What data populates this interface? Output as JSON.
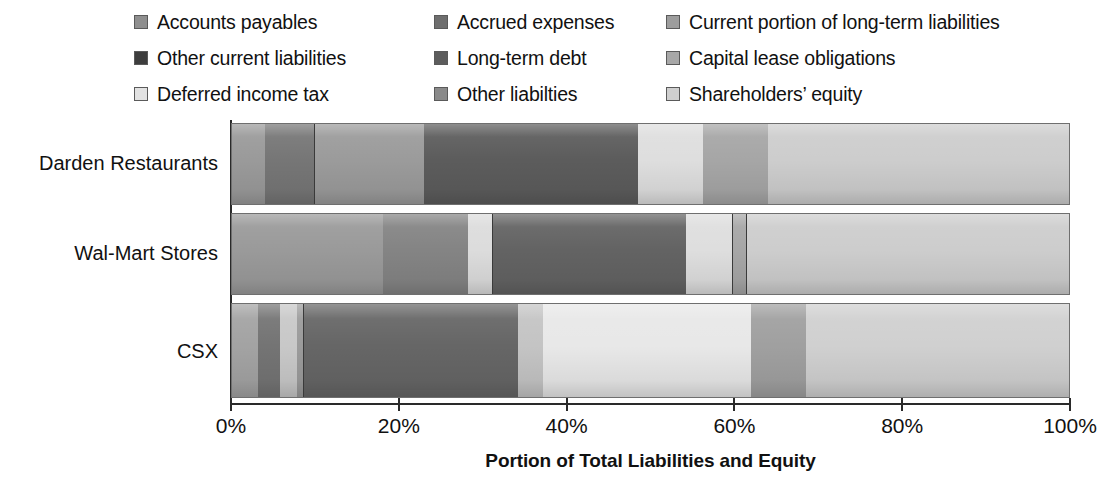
{
  "legend": {
    "items": [
      {
        "label": "Accounts payables",
        "color": "#8f8f8f",
        "swatch": "legend-swatch-accounts-payables"
      },
      {
        "label": "Accrued expenses",
        "color": "#6e6e6e",
        "swatch": "legend-swatch-accrued-expenses"
      },
      {
        "label": "Current portion of long-term liabilities",
        "color": "#9d9d9d",
        "swatch": "legend-swatch-current-portion"
      },
      {
        "label": "Other current liabilities",
        "color": "#3d3d3d",
        "swatch": "legend-swatch-other-current-liabilities"
      },
      {
        "label": "Long-term debt",
        "color": "#5c5c5c",
        "swatch": "legend-swatch-long-term-debt"
      },
      {
        "label": "Capital lease obligations",
        "color": "#a8a8a8",
        "swatch": "legend-swatch-capital-lease-obligations"
      },
      {
        "label": "Deferred income tax",
        "color": "#e2e2e2",
        "swatch": "legend-swatch-deferred-income-tax"
      },
      {
        "label": "Other liabilties",
        "color": "#8a8a8a",
        "swatch": "legend-swatch-other-liabilities"
      },
      {
        "label": "Shareholders’ equity",
        "color": "#cfcfcf",
        "swatch": "legend-swatch-shareholders-equity"
      }
    ]
  },
  "axis": {
    "x_title": "Portion of Total Liabilities and Equity",
    "ticks": [
      {
        "value": 0,
        "label": "0%"
      },
      {
        "value": 20,
        "label": "20%"
      },
      {
        "value": 40,
        "label": "40%"
      },
      {
        "value": 60,
        "label": "60%"
      },
      {
        "value": 80,
        "label": "80%"
      },
      {
        "value": 100,
        "label": "100%"
      }
    ],
    "xlim": [
      0,
      100
    ]
  },
  "chart_data": {
    "type": "bar",
    "orientation": "horizontal",
    "stacked": true,
    "normalized_percent": true,
    "title": "",
    "xlabel": "Portion of Total Liabilities and Equity",
    "ylabel": "",
    "xlim": [
      0,
      100
    ],
    "grid": false,
    "legend_position": "top",
    "categories": [
      "Darden Restaurants",
      "Wal-Mart Stores",
      "CSX"
    ],
    "series": [
      {
        "name": "Accounts payables",
        "color": "#8f8f8f",
        "values": [
          4.0,
          18.1,
          3.1
        ]
      },
      {
        "name": "Accrued expenses",
        "color": "#6e6e6e",
        "values": [
          5.9,
          10.1,
          2.6
        ]
      },
      {
        "name": "Current portion of long-term liabilities",
        "color": "#9d9d9d",
        "values": [
          13.0,
          3.0,
          2.1
        ]
      },
      {
        "name": "Other current liabilities",
        "color": "#3d3d3d",
        "values": [
          25.6,
          23.1,
          0.8
        ]
      },
      {
        "name": "Long-term debt",
        "color": "#5c5c5c",
        "values": [
          7.8,
          5.6,
          25.6
        ]
      },
      {
        "name": "Capital lease obligations",
        "color": "#a8a8a8",
        "values": [
          7.7,
          1.6,
          3.0
        ]
      },
      {
        "name": "Deferred income tax",
        "color": "#e2e2e2",
        "values": [
          0.0,
          0.0,
          24.8
        ]
      },
      {
        "name": "Other liabilties",
        "color": "#8a8a8a",
        "values": [
          0.0,
          0.0,
          6.6
        ]
      },
      {
        "name": "Shareholders’ equity",
        "color": "#cfcfcf",
        "values": [
          36.0,
          38.5,
          31.4
        ]
      }
    ]
  },
  "bars": [
    {
      "category": "Darden Restaurants",
      "segments": [
        {
          "name": "Accounts payables",
          "pct": 4.0,
          "color": "#9a9a9a",
          "divider": false
        },
        {
          "name": "Accrued expenses",
          "pct": 5.9,
          "color": "#767676",
          "divider": true
        },
        {
          "name": "Current portion of long-term liabilities",
          "pct": 13.0,
          "color": "#9b9b9b",
          "divider": false
        },
        {
          "name": "Other current liabilities",
          "pct": 25.6,
          "color": "#5c5c5c",
          "divider": false
        },
        {
          "name": "Deferred income tax",
          "pct": 7.8,
          "color": "#dedede",
          "divider": false
        },
        {
          "name": "Capital lease obligations",
          "pct": 7.7,
          "color": "#a6a6a6",
          "divider": false
        },
        {
          "name": "Shareholders’ equity",
          "pct": 36.0,
          "color": "#cdcdcd",
          "divider": false
        }
      ]
    },
    {
      "category": "Wal-Mart Stores",
      "segments": [
        {
          "name": "Accounts payables",
          "pct": 18.1,
          "color": "#9a9a9a",
          "divider": false
        },
        {
          "name": "Accrued expenses",
          "pct": 10.1,
          "color": "#848484",
          "divider": false
        },
        {
          "name": "Current portion of long-term liabilities",
          "pct": 3.0,
          "color": "#dcdcdc",
          "divider": true
        },
        {
          "name": "Other current liabilities",
          "pct": 23.1,
          "color": "#636363",
          "divider": false
        },
        {
          "name": "Deferred income tax",
          "pct": 5.6,
          "color": "#dedede",
          "divider": true
        },
        {
          "name": "Capital lease obligations",
          "pct": 1.6,
          "color": "#a6a6a6",
          "divider": true
        },
        {
          "name": "Shareholders’ equity",
          "pct": 38.5,
          "color": "#cdcdcd",
          "divider": false
        }
      ]
    },
    {
      "category": "CSX",
      "segments": [
        {
          "name": "Accounts payables",
          "pct": 3.1,
          "color": "#a3a3a3",
          "divider": false
        },
        {
          "name": "Accrued expenses",
          "pct": 2.6,
          "color": "#747474",
          "divider": false
        },
        {
          "name": "Current portion of long-term liabilities",
          "pct": 2.1,
          "color": "#c8c8c8",
          "divider": false
        },
        {
          "name": "Other current liabilities",
          "pct": 0.8,
          "color": "#9b9b9b",
          "divider": true
        },
        {
          "name": "Long-term debt",
          "pct": 25.6,
          "color": "#666666",
          "divider": false
        },
        {
          "name": "Capital lease obligations",
          "pct": 3.0,
          "color": "#c4c4c4",
          "divider": false
        },
        {
          "name": "Deferred income tax",
          "pct": 24.8,
          "color": "#e8e8e8",
          "divider": false
        },
        {
          "name": "Other liabilties",
          "pct": 6.6,
          "color": "#a0a0a0",
          "divider": false
        },
        {
          "name": "Shareholders’ equity",
          "pct": 31.4,
          "color": "#d0d0d0",
          "divider": false
        }
      ]
    }
  ]
}
